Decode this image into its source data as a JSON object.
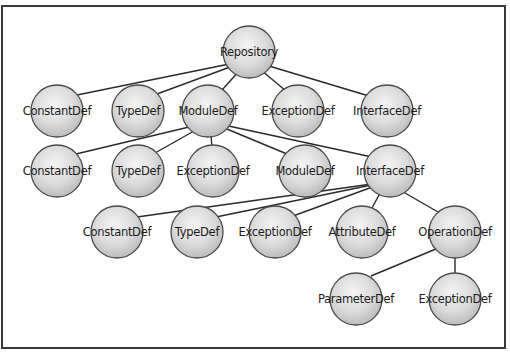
{
  "diagram": {
    "type": "tree",
    "title": "",
    "colors": {
      "background": "#ffffff",
      "frame": "#3a3a3a",
      "edge": "#2a2a2a",
      "sphere_light": "#f2f2f2",
      "sphere_mid": "#d9d9d9",
      "sphere_dark": "#b8b8b8",
      "sphere_stroke": "#4a4a4a",
      "label": "#1c1c1c"
    },
    "frame": {
      "x": 2,
      "y": 6,
      "width": 503,
      "height": 342
    },
    "node_radius": 26,
    "nodes": [
      {
        "id": "repository",
        "label": "Repository",
        "x": 249,
        "y": 52,
        "hub": [
          249,
          60
        ]
      },
      {
        "id": "r1-constantdef",
        "label": "ConstantDef",
        "x": 57,
        "y": 111
      },
      {
        "id": "r1-typedef",
        "label": "TypeDef",
        "x": 138,
        "y": 111
      },
      {
        "id": "r1-moduledef",
        "label": "ModuleDef",
        "x": 208,
        "y": 111,
        "hub": [
          210,
          122
        ]
      },
      {
        "id": "r1-exceptiondef",
        "label": "ExceptionDef",
        "x": 298,
        "y": 111
      },
      {
        "id": "r1-interfacedef",
        "label": "InterfaceDef",
        "x": 387,
        "y": 111
      },
      {
        "id": "r2-constantdef",
        "label": "ConstantDef",
        "x": 57,
        "y": 171
      },
      {
        "id": "r2-typedef",
        "label": "TypeDef",
        "x": 138,
        "y": 171
      },
      {
        "id": "r2-exceptiondef",
        "label": "ExceptionDef",
        "x": 213,
        "y": 171
      },
      {
        "id": "r2-moduledef",
        "label": "ModuleDef",
        "x": 305,
        "y": 171
      },
      {
        "id": "r2-interfacedef",
        "label": "InterfaceDef",
        "x": 390,
        "y": 171,
        "hub": [
          386,
          182
        ]
      },
      {
        "id": "r3-constantdef",
        "label": "ConstantDef",
        "x": 117,
        "y": 232
      },
      {
        "id": "r3-typedef",
        "label": "TypeDef",
        "x": 197,
        "y": 232
      },
      {
        "id": "r3-exceptiondef",
        "label": "ExceptionDef",
        "x": 275,
        "y": 232
      },
      {
        "id": "r3-attributedef",
        "label": "AttributeDef",
        "x": 362,
        "y": 232
      },
      {
        "id": "r3-operationdef",
        "label": "OperationDef",
        "x": 455,
        "y": 232,
        "hub": [
          455,
          241
        ]
      },
      {
        "id": "r4-parameterdef",
        "label": "ParameterDef",
        "x": 356,
        "y": 299
      },
      {
        "id": "r4-exceptiondef",
        "label": "ExceptionDef",
        "x": 455,
        "y": 299
      }
    ],
    "edges": [
      {
        "from": "repository",
        "to": "r1-constantdef",
        "end": [
          77,
          95
        ]
      },
      {
        "from": "repository",
        "to": "r1-typedef",
        "end": [
          157,
          94
        ]
      },
      {
        "from": "repository",
        "to": "r1-moduledef",
        "end": [
          222,
          90
        ]
      },
      {
        "from": "repository",
        "to": "r1-exceptiondef",
        "end": [
          286,
          91
        ]
      },
      {
        "from": "repository",
        "to": "r1-interfacedef",
        "end": [
          369,
          96
        ]
      },
      {
        "from": "r1-moduledef",
        "to": "r2-constantdef",
        "end": [
          76,
          154
        ]
      },
      {
        "from": "r1-moduledef",
        "to": "r2-typedef",
        "end": [
          155,
          153
        ]
      },
      {
        "from": "r1-moduledef",
        "to": "r2-exceptiondef",
        "end": [
          212,
          148
        ]
      },
      {
        "from": "r1-moduledef",
        "to": "r2-moduledef",
        "end": [
          287,
          154
        ]
      },
      {
        "from": "r1-moduledef",
        "to": "r2-interfacedef",
        "end": [
          372,
          157
        ]
      },
      {
        "from": "r2-interfacedef",
        "to": "r3-constantdef",
        "end": [
          137,
          217
        ]
      },
      {
        "from": "r2-interfacedef",
        "to": "r3-typedef",
        "end": [
          216,
          217
        ]
      },
      {
        "from": "r2-interfacedef",
        "to": "r3-exceptiondef",
        "end": [
          293,
          216
        ]
      },
      {
        "from": "r2-interfacedef",
        "to": "r3-attributedef",
        "end": [
          372,
          208
        ]
      },
      {
        "from": "r2-interfacedef",
        "to": "r3-operationdef",
        "end": [
          438,
          212
        ]
      },
      {
        "from": "r3-operationdef",
        "to": "r4-parameterdef",
        "end": [
          371,
          276
        ]
      },
      {
        "from": "r3-operationdef",
        "to": "r4-exceptiondef",
        "end": [
          455,
          273
        ]
      }
    ]
  }
}
